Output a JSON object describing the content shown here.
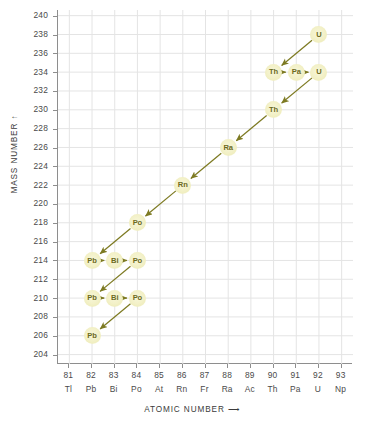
{
  "chart_data": {
    "type": "scatter",
    "title": "",
    "subtitle": "",
    "xlabel": "ATOMIC NUMBER",
    "ylabel": "MASS NUMBER",
    "xlim": [
      80.5,
      93.5
    ],
    "ylim": [
      203.0,
      240.6
    ],
    "grid": true,
    "legend": null,
    "x_ticks": [
      {
        "number": "81",
        "symbol": "Tl"
      },
      {
        "number": "82",
        "symbol": "Pb"
      },
      {
        "number": "83",
        "symbol": "Bi"
      },
      {
        "number": "84",
        "symbol": "Po"
      },
      {
        "number": "85",
        "symbol": "At"
      },
      {
        "number": "86",
        "symbol": "Rn"
      },
      {
        "number": "87",
        "symbol": "Fr"
      },
      {
        "number": "88",
        "symbol": "Ra"
      },
      {
        "number": "89",
        "symbol": "Ac"
      },
      {
        "number": "90",
        "symbol": "Th"
      },
      {
        "number": "91",
        "symbol": "Pa"
      },
      {
        "number": "92",
        "symbol": "U"
      },
      {
        "number": "93",
        "symbol": "Np"
      }
    ],
    "y_ticks": [
      "240",
      "238",
      "236",
      "234",
      "232",
      "230",
      "228",
      "226",
      "224",
      "222",
      "220",
      "218",
      "216",
      "214",
      "212",
      "210",
      "208",
      "206",
      "204"
    ],
    "nodes": [
      {
        "label": "U",
        "z": 92,
        "a": 238
      },
      {
        "label": "Th",
        "z": 90,
        "a": 234
      },
      {
        "label": "Pa",
        "z": 91,
        "a": 234
      },
      {
        "label": "U",
        "z": 92,
        "a": 234
      },
      {
        "label": "Th",
        "z": 90,
        "a": 230
      },
      {
        "label": "Ra",
        "z": 88,
        "a": 226
      },
      {
        "label": "Rn",
        "z": 86,
        "a": 222
      },
      {
        "label": "Po",
        "z": 84,
        "a": 218
      },
      {
        "label": "Pb",
        "z": 82,
        "a": 214
      },
      {
        "label": "Bi",
        "z": 83,
        "a": 214
      },
      {
        "label": "Po",
        "z": 84,
        "a": 214
      },
      {
        "label": "Pb",
        "z": 82,
        "a": 210
      },
      {
        "label": "Bi",
        "z": 83,
        "a": 210
      },
      {
        "label": "Po",
        "z": 84,
        "a": 210
      },
      {
        "label": "Pb",
        "z": 82,
        "a": 206
      }
    ],
    "arrows": [
      {
        "from": {
          "z": 92,
          "a": 238
        },
        "to": {
          "z": 90,
          "a": 234
        },
        "decay": "alpha"
      },
      {
        "from": {
          "z": 90,
          "a": 234
        },
        "to": {
          "z": 91,
          "a": 234
        },
        "decay": "beta"
      },
      {
        "from": {
          "z": 91,
          "a": 234
        },
        "to": {
          "z": 92,
          "a": 234
        },
        "decay": "beta"
      },
      {
        "from": {
          "z": 92,
          "a": 234
        },
        "to": {
          "z": 90,
          "a": 230
        },
        "decay": "alpha"
      },
      {
        "from": {
          "z": 90,
          "a": 230
        },
        "to": {
          "z": 88,
          "a": 226
        },
        "decay": "alpha"
      },
      {
        "from": {
          "z": 88,
          "a": 226
        },
        "to": {
          "z": 86,
          "a": 222
        },
        "decay": "alpha"
      },
      {
        "from": {
          "z": 86,
          "a": 222
        },
        "to": {
          "z": 84,
          "a": 218
        },
        "decay": "alpha"
      },
      {
        "from": {
          "z": 84,
          "a": 218
        },
        "to": {
          "z": 82,
          "a": 214
        },
        "decay": "alpha"
      },
      {
        "from": {
          "z": 82,
          "a": 214
        },
        "to": {
          "z": 83,
          "a": 214
        },
        "decay": "beta"
      },
      {
        "from": {
          "z": 83,
          "a": 214
        },
        "to": {
          "z": 84,
          "a": 214
        },
        "decay": "beta"
      },
      {
        "from": {
          "z": 84,
          "a": 214
        },
        "to": {
          "z": 82,
          "a": 210
        },
        "decay": "alpha"
      },
      {
        "from": {
          "z": 82,
          "a": 210
        },
        "to": {
          "z": 83,
          "a": 210
        },
        "decay": "beta"
      },
      {
        "from": {
          "z": 83,
          "a": 210
        },
        "to": {
          "z": 84,
          "a": 210
        },
        "decay": "beta"
      },
      {
        "from": {
          "z": 84,
          "a": 210
        },
        "to": {
          "z": 82,
          "a": 206
        },
        "decay": "alpha"
      }
    ]
  },
  "axes": {
    "ylabel_text": "MASS NUMBER",
    "ylabel_arrow": "↑",
    "xlabel_text": "ATOMIC NUMBER",
    "xlabel_arrow": "⟶"
  },
  "colors": {
    "node_fill": "#f2f0c6",
    "node_text": "#6c6a1e",
    "arrow": "#7d7a22",
    "grid": "#e4e4e4",
    "axis": "#8e8e8e",
    "tick_text": "#4a4a4a",
    "background": "#ffffff"
  }
}
